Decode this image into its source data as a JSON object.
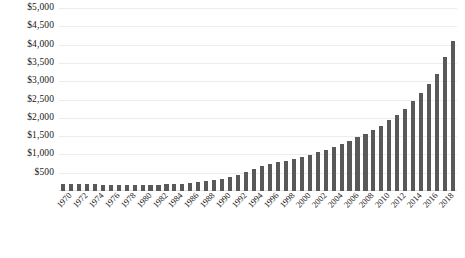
{
  "chart_data": {
    "type": "bar",
    "title": "",
    "subtitle": "",
    "xlabel": "",
    "ylabel": "",
    "ylim": [
      0,
      5000
    ],
    "ytick_step": 500,
    "grid": true,
    "legend": false,
    "legend_position": "none",
    "bar_color": "#595959",
    "gridline_color": "#ececed",
    "y_ticks": [
      {
        "value": 500,
        "label": "$500"
      },
      {
        "value": 1000,
        "label": "$1,000"
      },
      {
        "value": 1500,
        "label": "$1,500"
      },
      {
        "value": 2000,
        "label": "$2,000"
      },
      {
        "value": 2500,
        "label": "$2,500"
      },
      {
        "value": 3000,
        "label": "$3,000"
      },
      {
        "value": 3500,
        "label": "$3,500"
      },
      {
        "value": 4000,
        "label": "$4,000"
      },
      {
        "value": 4500,
        "label": "$4,500"
      },
      {
        "value": 5000,
        "label": "$5,000"
      }
    ],
    "x_tick_labels": [
      "1970",
      "1972",
      "1974",
      "1976",
      "1978",
      "1980",
      "1982",
      "1984",
      "1986",
      "1988",
      "1990",
      "1992",
      "1994",
      "1996",
      "1998",
      "2000",
      "2002",
      "2004",
      "2006",
      "2008",
      "2010",
      "2012",
      "2014",
      "2016",
      "2018"
    ],
    "x_tick_interval": 2,
    "categories": [
      "1970",
      "1971",
      "1972",
      "1973",
      "1974",
      "1975",
      "1976",
      "1977",
      "1978",
      "1979",
      "1980",
      "1981",
      "1982",
      "1983",
      "1984",
      "1985",
      "1986",
      "1987",
      "1988",
      "1989",
      "1990",
      "1991",
      "1992",
      "1993",
      "1994",
      "1995",
      "1996",
      "1997",
      "1998",
      "1999",
      "2000",
      "2001",
      "2002",
      "2003",
      "2004",
      "2005",
      "2006",
      "2007",
      "2008",
      "2009",
      "2010",
      "2011",
      "2012",
      "2013",
      "2014",
      "2015",
      "2016",
      "2017",
      "2018",
      "2019"
    ],
    "values": [
      190,
      195,
      190,
      185,
      180,
      175,
      170,
      170,
      165,
      160,
      160,
      165,
      170,
      180,
      190,
      205,
      220,
      240,
      265,
      300,
      340,
      390,
      450,
      520,
      600,
      680,
      740,
      790,
      830,
      870,
      930,
      990,
      1060,
      1120,
      1190,
      1280,
      1380,
      1470,
      1560,
      1660,
      1790,
      1930,
      2080,
      2250,
      2450,
      2670,
      2930,
      3200,
      3650,
      4100
    ]
  }
}
